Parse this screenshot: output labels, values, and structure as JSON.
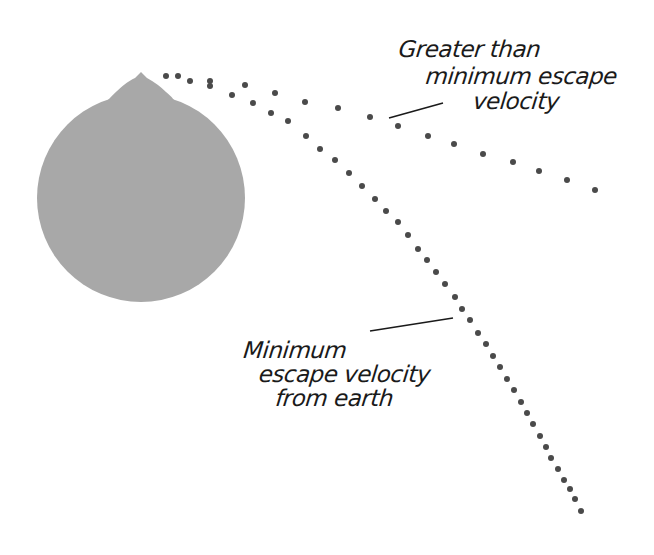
{
  "diagram": {
    "earth": {
      "name": "earth",
      "center": [
        141,
        198
      ],
      "radius": 104,
      "fill": "#a8a8a8",
      "bump_peak": [
        141,
        72
      ]
    },
    "trajectories": [
      {
        "name": "greater-than-minimum-escape-velocity",
        "dot_color": "#4a4a4a",
        "dot_radius": 3,
        "points": [
          [
            166,
            76
          ],
          [
            178,
            76
          ],
          [
            190,
            81
          ],
          [
            210,
            81
          ],
          [
            245,
            85
          ],
          [
            275,
            93
          ],
          [
            305,
            102
          ],
          [
            338,
            108
          ],
          [
            370,
            117
          ],
          [
            398,
            126
          ],
          [
            428,
            136
          ],
          [
            454,
            144
          ],
          [
            483,
            154
          ],
          [
            513,
            162
          ],
          [
            539,
            171
          ],
          [
            567,
            180
          ],
          [
            595,
            190
          ]
        ]
      },
      {
        "name": "minimum-escape-velocity",
        "dot_color": "#4a4a4a",
        "dot_radius": 3,
        "points": [
          [
            210,
            86
          ],
          [
            232,
            95
          ],
          [
            253,
            103
          ],
          [
            271,
            113
          ],
          [
            288,
            121
          ],
          [
            306,
            136
          ],
          [
            320,
            149
          ],
          [
            335,
            160
          ],
          [
            349,
            173
          ],
          [
            362,
            186
          ],
          [
            375,
            199
          ],
          [
            386,
            211
          ],
          [
            398,
            222
          ],
          [
            408,
            235
          ],
          [
            418,
            249
          ],
          [
            427,
            260
          ],
          [
            436,
            272
          ],
          [
            445,
            284
          ],
          [
            455,
            297
          ],
          [
            462,
            309
          ],
          [
            470,
            320
          ],
          [
            478,
            333
          ],
          [
            486,
            344
          ],
          [
            493,
            356
          ],
          [
            500,
            367
          ],
          [
            507,
            379
          ],
          [
            514,
            390
          ],
          [
            521,
            402
          ],
          [
            527,
            413
          ],
          [
            533,
            424
          ],
          [
            540,
            436
          ],
          [
            546,
            447
          ],
          [
            551,
            458
          ],
          [
            558,
            469
          ],
          [
            564,
            480
          ],
          [
            570,
            489
          ],
          [
            575,
            499
          ],
          [
            581,
            511
          ]
        ]
      }
    ],
    "labels": {
      "upper": {
        "lines": [
          "Greater than",
          "minimum escape",
          "velocity"
        ],
        "leader_line": [
          [
            389,
            118
          ],
          [
            443,
            103
          ]
        ]
      },
      "lower": {
        "lines": [
          "Minimum",
          "escape velocity",
          "from earth"
        ],
        "leader_line": [
          [
            370,
            331
          ],
          [
            453,
            318
          ]
        ]
      }
    }
  }
}
